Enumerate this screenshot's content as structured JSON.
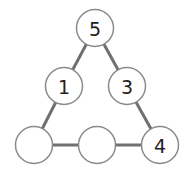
{
  "diagram": {
    "type": "number-triangle-puzzle",
    "colors": {
      "edge": "#707070",
      "node_stroke": "#8a8a8a",
      "node_fill": "#ffffff",
      "text": "#222222"
    },
    "nodes": [
      {
        "id": "top",
        "label": "5",
        "cx": 95,
        "cy": 28
      },
      {
        "id": "mid-left",
        "label": "1",
        "cx": 64,
        "cy": 86
      },
      {
        "id": "mid-right",
        "label": "3",
        "cx": 127,
        "cy": 86
      },
      {
        "id": "bottom-left",
        "label": "",
        "cx": 34,
        "cy": 145
      },
      {
        "id": "bottom-middle",
        "label": "",
        "cx": 97,
        "cy": 145
      },
      {
        "id": "bottom-right",
        "label": "4",
        "cx": 160,
        "cy": 145
      }
    ],
    "edges": [
      [
        "top",
        "mid-left"
      ],
      [
        "mid-left",
        "bottom-left"
      ],
      [
        "top",
        "mid-right"
      ],
      [
        "mid-right",
        "bottom-right"
      ],
      [
        "bottom-left",
        "bottom-middle"
      ],
      [
        "bottom-middle",
        "bottom-right"
      ]
    ]
  }
}
